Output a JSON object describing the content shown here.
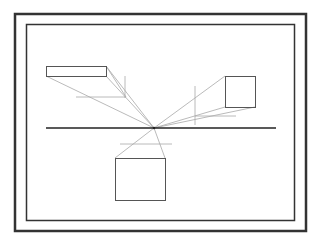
{
  "diagram": {
    "colors": {
      "frame": "#333333",
      "object_outline": "#555555",
      "horizon": "#222222",
      "construction": "#a8a8a8",
      "background": "#ffffff"
    },
    "horizon_line": {
      "x1": 46,
      "y1": 128,
      "x2": 276,
      "y2": 128
    },
    "vanishing_point": {
      "x": 154,
      "y": 128
    },
    "objects": [
      {
        "name": "left-box",
        "x": 46,
        "y": 66,
        "w": 60,
        "h": 10
      },
      {
        "name": "right-box",
        "x": 225,
        "y": 76,
        "w": 30,
        "h": 31
      },
      {
        "name": "bottom-box",
        "x": 115,
        "y": 158,
        "w": 50,
        "h": 42
      }
    ]
  }
}
